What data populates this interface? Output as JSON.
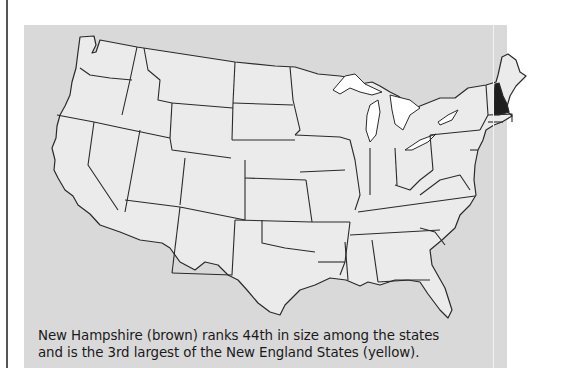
{
  "figure": {
    "type": "choropleth-locator-map",
    "region": "Contiguous United States",
    "highlighted_state": "New Hampshire",
    "colors": {
      "panel_background": "#d9d9d9",
      "state_fill": "#ebebeb",
      "highlight_fill": "#1e1e1e",
      "lakes": "#ffffff",
      "borders": "#2a2a2a"
    }
  },
  "caption": {
    "line1": "New Hampshire (brown) ranks 44th in size among the states",
    "line2": "and is the 3rd largest of the New England States (yellow)."
  }
}
